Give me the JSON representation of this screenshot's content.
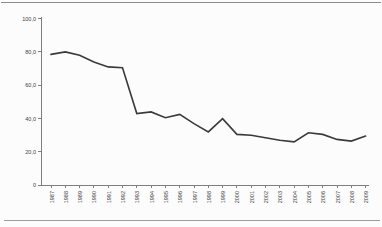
{
  "page": {
    "background": "#fcfcfc"
  },
  "colors": {
    "series_line": "#3a3a3a",
    "axis": "#7f7f7f",
    "tick_text": "#404040",
    "top_rule": "#8c8c8c",
    "bottom_rule": "#9e9e9e"
  },
  "chart_data": {
    "type": "line",
    "title": "",
    "xlabel": "",
    "ylabel": "",
    "categories": [
      "1987",
      "1988",
      "1989",
      "1990",
      "1991",
      "1992",
      "1993",
      "1994",
      "1995",
      "1996",
      "1997",
      "1998",
      "1999",
      "2000",
      "2001",
      "2002",
      "2003",
      "2004",
      "2005",
      "2006",
      "2007",
      "2008",
      "2009"
    ],
    "values": [
      78.5,
      80,
      78,
      74,
      71,
      70.5,
      43,
      44,
      40.5,
      42.5,
      37,
      32,
      40,
      30.5,
      30,
      28.5,
      27,
      26,
      31.5,
      30.5,
      27.5,
      26.5,
      29.5
    ],
    "ylim": [
      0,
      100
    ],
    "yticks": [
      0,
      20,
      40,
      60,
      80,
      100
    ],
    "ytick_labels": [
      "0",
      "20,0",
      "40,0",
      "60,0",
      "80,0",
      "100,0"
    ],
    "x_label_rotation_deg": -90,
    "grid": false,
    "legend": "none",
    "decimal_separator": ","
  }
}
